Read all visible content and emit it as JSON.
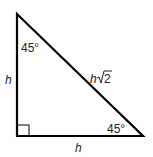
{
  "diagram": {
    "type": "45-45-90 right triangle",
    "angles": {
      "top": "45°",
      "bottom_right": "45°"
    },
    "sides": {
      "left": "h",
      "bottom": "h",
      "hypotenuse_var": "h",
      "hypotenuse_root": "2"
    },
    "right_angle_marker": true,
    "stroke_color": "#000000"
  }
}
